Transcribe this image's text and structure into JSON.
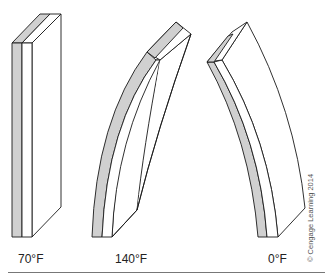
{
  "figure": {
    "strips": [
      {
        "id": "room",
        "label": "70°F",
        "shape": "straight"
      },
      {
        "id": "hot",
        "label": "140°F",
        "shape": "bent-right"
      },
      {
        "id": "cold",
        "label": "0°F",
        "shape": "bent-left"
      }
    ],
    "credit": "© Cengage Learning 2014",
    "colors": {
      "metal_a": "#d0d0d0",
      "metal_b": "#ffffff",
      "stroke": "#1a1a1a"
    }
  }
}
